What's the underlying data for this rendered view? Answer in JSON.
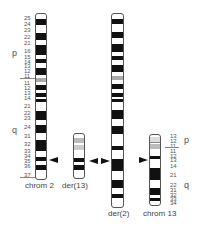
{
  "chromosomes": [
    {
      "id": "chrom2",
      "caption": "chrom 2"
    },
    {
      "id": "der13",
      "caption": "der(13)"
    },
    {
      "id": "der2",
      "caption": "der(2)"
    },
    {
      "id": "chrom13",
      "caption": "chrom 13"
    }
  ],
  "chrom2_labels": {
    "arm_p": "p",
    "arm_q": "q",
    "p_bands": [
      "25",
      "24",
      "23",
      "22",
      "21",
      "16",
      "15",
      "14",
      "13",
      "12",
      "11"
    ],
    "q_bands": [
      "11",
      "12",
      "13",
      "14",
      "21",
      "22",
      "23",
      "24",
      "31",
      "32",
      "33",
      "34",
      "35",
      "36",
      "37"
    ]
  },
  "chrom13_labels": {
    "arm_p": "p",
    "arm_q": "q",
    "bands": [
      "13",
      "12",
      "11",
      "11",
      "12",
      "13",
      "14",
      "21",
      "22",
      "31",
      "32",
      "33",
      "34"
    ]
  }
}
